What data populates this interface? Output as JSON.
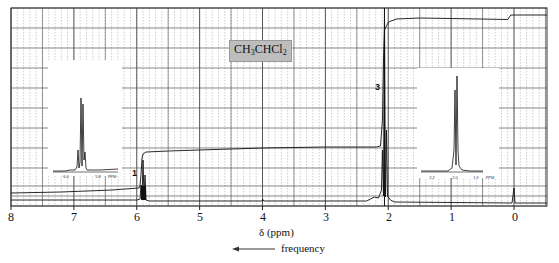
{
  "chart_data": {
    "type": "line",
    "title": "CH3CHCl2",
    "compound": {
      "prefix": "CH",
      "sub1": "3",
      "mid": "CHCl",
      "sub2": "2"
    },
    "xlabel": "δ (ppm)",
    "ylabel": "",
    "x_direction": "reversed",
    "xlim": [
      8,
      -0.5
    ],
    "x_ticks": [
      8,
      7,
      6,
      5,
      4,
      3,
      2,
      1,
      0
    ],
    "x_tick_labels": [
      "8",
      "7",
      "6",
      "5",
      "4",
      "3",
      "2",
      "1",
      "0"
    ],
    "grid": true,
    "annotation_frequency": "frequency",
    "peaks": [
      {
        "shift_ppm": 5.9,
        "multiplicity": "quartet",
        "integration_label": "1"
      },
      {
        "shift_ppm": 2.06,
        "multiplicity": "doublet",
        "integration_label": "3"
      },
      {
        "shift_ppm": 0.0,
        "multiplicity": "singlet",
        "note": "TMS reference"
      }
    ],
    "integration_curve": {
      "description": "step integral trace",
      "steps": [
        {
          "at_ppm": 5.9,
          "relative_height": 1
        },
        {
          "at_ppm": 2.06,
          "relative_height": 3
        }
      ]
    },
    "insets": [
      {
        "name": "expansion-5.9",
        "x_ticks": [
          "6.0",
          "5.8"
        ],
        "unit": "PPM",
        "multiplicity": "quartet"
      },
      {
        "name": "expansion-2.0",
        "x_ticks": [
          "2.2",
          "2.0",
          "1.9"
        ],
        "unit": "PPM",
        "multiplicity": "doublet"
      }
    ]
  },
  "labels": {
    "integration_1": "1",
    "integration_3": "3",
    "xlabel": "δ (ppm)",
    "frequency": "frequency",
    "ticks": [
      "8",
      "7",
      "6",
      "5",
      "4",
      "3",
      "2",
      "1",
      "0"
    ],
    "inset_left_ticks": [
      "6.0",
      "5.8",
      "PPM"
    ],
    "inset_right_ticks": [
      "2.2",
      "2.0",
      "1.9",
      "PPM"
    ]
  },
  "colors": {
    "grid_major": "#555555",
    "grid_minor": "#9a9a9a",
    "trace": "#111111",
    "label_bg": "#bdbdbd"
  }
}
